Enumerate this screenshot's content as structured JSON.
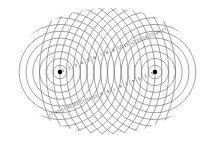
{
  "diagram": {
    "type": "two-source concentric wave interference",
    "line_color": "#7a7a7a",
    "dot_color": "#000000",
    "background": "#ffffff",
    "ring_spacing_px": 6.8,
    "ring_count": 17,
    "clip": {
      "cx": 107,
      "cy": 71,
      "rx": 93,
      "ry": 63
    },
    "sources": [
      {
        "id": "left",
        "x": 60,
        "y": 72
      },
      {
        "id": "right",
        "x": 155,
        "y": 72
      }
    ],
    "labels": {
      "left_source_upper_right": [
        "1",
        "2",
        "3",
        "4",
        "5",
        "6",
        "7",
        "8",
        "9",
        "10",
        "11",
        "12",
        "13",
        "14",
        "15",
        "16",
        "17"
      ],
      "right_source_lower_left": [
        "1",
        "2",
        "3",
        "4",
        "5",
        "6",
        "7",
        "8",
        "9",
        "10",
        "11",
        "12",
        "13",
        "14",
        "15",
        "16",
        "17"
      ]
    }
  }
}
